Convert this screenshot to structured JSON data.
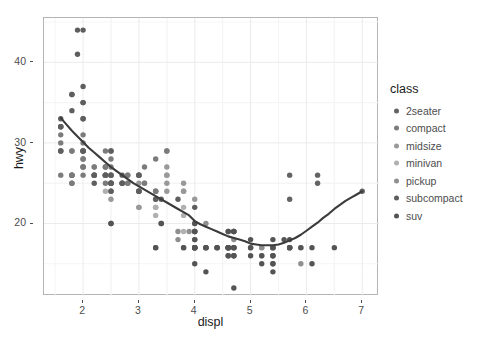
{
  "chart_data": {
    "type": "scatter",
    "title": "",
    "subtitle": "",
    "xlabel": "displ",
    "ylabel": "hwy",
    "xlim": [
      1.3,
      7.3
    ],
    "ylim": [
      11.0,
      45.5
    ],
    "xticks": [
      2,
      3,
      4,
      5,
      6,
      7
    ],
    "yticks": [
      20,
      30,
      40
    ],
    "grid": true,
    "grid_color": "#ebebeb",
    "panel_background": "#ffffff",
    "panel_border_color": "#b4b4b4",
    "legend": {
      "title": "class",
      "position": "right",
      "entries": [
        {
          "label": "2seater",
          "color": "#636363"
        },
        {
          "label": "compact",
          "color": "#7b7b7b"
        },
        {
          "label": "midsize",
          "color": "#999999"
        },
        {
          "label": "minivan",
          "color": "#b0b0b0"
        },
        {
          "label": "pickup",
          "color": "#8f8f8f"
        },
        {
          "label": "subcompact",
          "color": "#5e5e5e"
        },
        {
          "label": "suv",
          "color": "#545454"
        }
      ]
    },
    "smooth": {
      "method": "loess",
      "color": "#3b3b3b",
      "width": 2.1,
      "points": [
        [
          1.6,
          33.1
        ],
        [
          1.7,
          32.3
        ],
        [
          1.8,
          31.5
        ],
        [
          1.9,
          30.8
        ],
        [
          2.0,
          30.1
        ],
        [
          2.1,
          29.4
        ],
        [
          2.2,
          28.8
        ],
        [
          2.3,
          28.2
        ],
        [
          2.4,
          27.6
        ],
        [
          2.5,
          27.0
        ],
        [
          2.6,
          26.5
        ],
        [
          2.7,
          26.0
        ],
        [
          2.8,
          25.5
        ],
        [
          2.9,
          25.0
        ],
        [
          3.0,
          24.6
        ],
        [
          3.1,
          24.2
        ],
        [
          3.2,
          23.8
        ],
        [
          3.3,
          23.4
        ],
        [
          3.4,
          23.0
        ],
        [
          3.5,
          22.6
        ],
        [
          3.6,
          22.2
        ],
        [
          3.7,
          21.8
        ],
        [
          3.8,
          21.4
        ],
        [
          3.9,
          21.0
        ],
        [
          4.0,
          20.3
        ],
        [
          4.1,
          19.9
        ],
        [
          4.2,
          19.6
        ],
        [
          4.3,
          19.3
        ],
        [
          4.4,
          19.0
        ],
        [
          4.5,
          18.7
        ],
        [
          4.6,
          18.4
        ],
        [
          4.7,
          18.2
        ],
        [
          4.8,
          18.0
        ],
        [
          4.9,
          17.8
        ],
        [
          5.0,
          17.5
        ],
        [
          5.1,
          17.4
        ],
        [
          5.2,
          17.3
        ],
        [
          5.3,
          17.3
        ],
        [
          5.4,
          17.3
        ],
        [
          5.5,
          17.4
        ],
        [
          5.6,
          17.6
        ],
        [
          5.7,
          17.9
        ],
        [
          5.8,
          18.2
        ],
        [
          5.9,
          18.6
        ],
        [
          6.0,
          19.1
        ],
        [
          6.1,
          19.6
        ],
        [
          6.2,
          20.1
        ],
        [
          6.3,
          20.7
        ],
        [
          6.4,
          21.2
        ],
        [
          6.5,
          21.8
        ],
        [
          6.6,
          22.3
        ],
        [
          6.7,
          22.8
        ],
        [
          6.8,
          23.2
        ],
        [
          6.9,
          23.6
        ],
        [
          7.0,
          24.0
        ]
      ]
    },
    "series": [
      {
        "name": "2seater",
        "color": "#636363",
        "points": [
          [
            5.7,
            26
          ],
          [
            5.7,
            23
          ],
          [
            6.2,
            26
          ],
          [
            6.2,
            25
          ],
          [
            7.0,
            24
          ]
        ]
      },
      {
        "name": "compact",
        "color": "#7b7b7b",
        "points": [
          [
            1.8,
            29
          ],
          [
            1.8,
            29
          ],
          [
            2.0,
            31
          ],
          [
            2.0,
            30
          ],
          [
            2.8,
            26
          ],
          [
            2.8,
            26
          ],
          [
            3.1,
            27
          ],
          [
            1.8,
            26
          ],
          [
            1.8,
            25
          ],
          [
            2.0,
            28
          ],
          [
            2.0,
            27
          ],
          [
            2.8,
            25
          ],
          [
            2.8,
            25
          ],
          [
            3.1,
            25
          ],
          [
            1.6,
            29
          ],
          [
            1.6,
            29
          ],
          [
            1.6,
            31
          ],
          [
            1.6,
            30
          ],
          [
            1.6,
            26
          ],
          [
            1.8,
            26
          ],
          [
            1.8,
            26
          ],
          [
            2.0,
            27
          ],
          [
            2.4,
            26
          ],
          [
            2.4,
            25
          ],
          [
            2.5,
            28
          ],
          [
            2.5,
            27
          ],
          [
            3.3,
            28
          ],
          [
            2.0,
            26
          ],
          [
            2.0,
            29
          ],
          [
            2.4,
            27
          ],
          [
            2.4,
            26
          ],
          [
            2.5,
            26
          ],
          [
            2.2,
            27
          ],
          [
            2.2,
            26
          ],
          [
            2.5,
            26
          ],
          [
            2.5,
            25
          ],
          [
            3.0,
            26
          ],
          [
            3.5,
            29
          ],
          [
            3.5,
            29
          ],
          [
            3.0,
            26
          ],
          [
            2.2,
            26
          ],
          [
            2.2,
            26
          ],
          [
            2.4,
            29
          ],
          [
            2.4,
            27
          ],
          [
            3.3,
            24
          ],
          [
            1.8,
            26
          ],
          [
            1.8,
            25
          ],
          [
            2.0,
            28
          ],
          [
            2.0,
            27
          ]
        ]
      },
      {
        "name": "midsize",
        "color": "#999999",
        "points": [
          [
            2.4,
            26
          ],
          [
            3.0,
            24
          ],
          [
            3.0,
            24
          ],
          [
            3.5,
            27
          ],
          [
            2.2,
            26
          ],
          [
            2.2,
            27
          ],
          [
            2.4,
            26
          ],
          [
            3.0,
            25
          ],
          [
            3.3,
            24
          ],
          [
            2.4,
            27
          ],
          [
            2.4,
            26
          ],
          [
            3.1,
            25
          ],
          [
            3.5,
            25
          ],
          [
            2.5,
            23
          ],
          [
            2.5,
            24
          ],
          [
            3.0,
            24
          ],
          [
            3.0,
            22
          ],
          [
            3.0,
            22
          ],
          [
            3.5,
            24
          ],
          [
            3.8,
            25
          ],
          [
            3.8,
            24
          ],
          [
            3.8,
            24
          ],
          [
            4.0,
            23
          ],
          [
            2.4,
            26
          ],
          [
            2.4,
            26
          ],
          [
            3.3,
            23
          ],
          [
            3.3,
            24
          ],
          [
            3.0,
            26
          ],
          [
            3.0,
            26
          ],
          [
            3.5,
            26
          ],
          [
            3.5,
            26
          ],
          [
            2.5,
            26
          ],
          [
            2.5,
            25
          ],
          [
            2.5,
            24
          ]
        ]
      },
      {
        "name": "minivan",
        "color": "#b0b0b0",
        "points": [
          [
            2.4,
            24
          ],
          [
            3.0,
            24
          ],
          [
            3.3,
            22
          ],
          [
            3.3,
            22
          ],
          [
            3.3,
            24
          ],
          [
            3.3,
            22
          ],
          [
            3.3,
            21
          ],
          [
            3.8,
            21
          ],
          [
            3.8,
            19
          ],
          [
            3.8,
            22
          ],
          [
            4.0,
            18
          ]
        ]
      },
      {
        "name": "pickup",
        "color": "#8f8f8f",
        "points": [
          [
            4.7,
            19
          ],
          [
            5.7,
            17
          ],
          [
            5.9,
            17
          ],
          [
            4.7,
            19
          ],
          [
            4.7,
            16
          ],
          [
            5.2,
            17
          ],
          [
            5.2,
            17
          ],
          [
            3.9,
            19
          ],
          [
            4.7,
            17
          ],
          [
            5.2,
            16
          ],
          [
            5.7,
            17
          ],
          [
            5.9,
            15
          ],
          [
            4.6,
            17
          ],
          [
            5.4,
            17
          ],
          [
            4.0,
            20
          ],
          [
            4.0,
            18
          ],
          [
            4.6,
            17
          ],
          [
            5.0,
            17
          ],
          [
            4.2,
            20
          ],
          [
            4.2,
            17
          ],
          [
            4.6,
            16
          ],
          [
            4.6,
            16
          ],
          [
            4.6,
            17
          ],
          [
            5.4,
            17
          ],
          [
            5.4,
            16
          ],
          [
            4.0,
            19
          ],
          [
            4.0,
            19
          ],
          [
            4.6,
            17
          ],
          [
            5.0,
            17
          ],
          [
            3.7,
            19
          ],
          [
            3.7,
            18
          ],
          [
            4.0,
            17
          ],
          [
            4.7,
            18
          ]
        ]
      },
      {
        "name": "subcompact",
        "color": "#5e5e5e",
        "points": [
          [
            2.5,
            25
          ],
          [
            2.5,
            25
          ],
          [
            3.3,
            23
          ],
          [
            2.0,
            33
          ],
          [
            2.0,
            35
          ],
          [
            2.7,
            25
          ],
          [
            2.7,
            25
          ],
          [
            3.0,
            24
          ],
          [
            3.7,
            23
          ],
          [
            4.0,
            22
          ],
          [
            2.2,
            26
          ],
          [
            2.2,
            25
          ],
          [
            2.5,
            25
          ],
          [
            2.5,
            24
          ],
          [
            3.0,
            24
          ],
          [
            2.7,
            26
          ],
          [
            2.7,
            25
          ],
          [
            3.4,
            23
          ],
          [
            1.6,
            33
          ],
          [
            1.6,
            32
          ],
          [
            1.6,
            32
          ],
          [
            1.6,
            29
          ],
          [
            1.6,
            32
          ],
          [
            1.8,
            34
          ],
          [
            1.8,
            36
          ],
          [
            1.8,
            36
          ],
          [
            2.0,
            29
          ],
          [
            2.4,
            26
          ],
          [
            1.9,
            44
          ],
          [
            2.0,
            29
          ],
          [
            2.0,
            29
          ],
          [
            2.5,
            29
          ],
          [
            2.5,
            29
          ],
          [
            1.9,
            41
          ],
          [
            2.0,
            44
          ],
          [
            3.0,
            26
          ],
          [
            2.0,
            33
          ],
          [
            2.0,
            37
          ],
          [
            2.0,
            35
          ],
          [
            2.5,
            26
          ]
        ]
      },
      {
        "name": "suv",
        "color": "#545454",
        "points": [
          [
            4.0,
            17
          ],
          [
            4.0,
            17
          ],
          [
            4.6,
            17
          ],
          [
            5.0,
            16
          ],
          [
            4.2,
            17
          ],
          [
            4.2,
            17
          ],
          [
            4.4,
            17
          ],
          [
            4.6,
            16
          ],
          [
            5.4,
            15
          ],
          [
            5.4,
            15
          ],
          [
            4.0,
            17
          ],
          [
            4.7,
            17
          ],
          [
            4.7,
            17
          ],
          [
            4.7,
            17
          ],
          [
            5.7,
            17
          ],
          [
            6.1,
            15
          ],
          [
            4.0,
            15
          ],
          [
            4.2,
            14
          ],
          [
            4.4,
            17
          ],
          [
            4.6,
            17
          ],
          [
            5.4,
            14
          ],
          [
            5.4,
            16
          ],
          [
            5.4,
            16
          ],
          [
            4.0,
            19
          ],
          [
            4.0,
            19
          ],
          [
            4.6,
            19
          ],
          [
            5.0,
            18
          ],
          [
            2.5,
            20
          ],
          [
            2.5,
            20
          ],
          [
            3.4,
            20
          ],
          [
            3.4,
            20
          ],
          [
            4.0,
            20
          ],
          [
            4.7,
            19
          ],
          [
            4.7,
            19
          ],
          [
            4.7,
            16
          ],
          [
            5.7,
            18
          ],
          [
            6.1,
            17
          ],
          [
            4.0,
            17
          ],
          [
            4.2,
            17
          ],
          [
            4.4,
            17
          ],
          [
            4.6,
            17
          ],
          [
            5.4,
            17
          ],
          [
            5.4,
            17
          ],
          [
            3.3,
            17
          ],
          [
            3.3,
            17
          ],
          [
            4.0,
            18
          ],
          [
            5.6,
            18
          ],
          [
            3.8,
            17
          ],
          [
            3.8,
            17
          ],
          [
            4.0,
            17
          ],
          [
            4.0,
            17
          ],
          [
            4.6,
            17
          ],
          [
            5.0,
            17
          ],
          [
            4.7,
            12
          ],
          [
            5.7,
            17
          ],
          [
            6.5,
            17
          ],
          [
            4.7,
            16
          ],
          [
            5.2,
            16
          ],
          [
            5.2,
            15
          ],
          [
            5.7,
            17
          ],
          [
            5.9,
            17
          ],
          [
            4.6,
            19
          ],
          [
            5.4,
            18
          ]
        ]
      }
    ]
  }
}
